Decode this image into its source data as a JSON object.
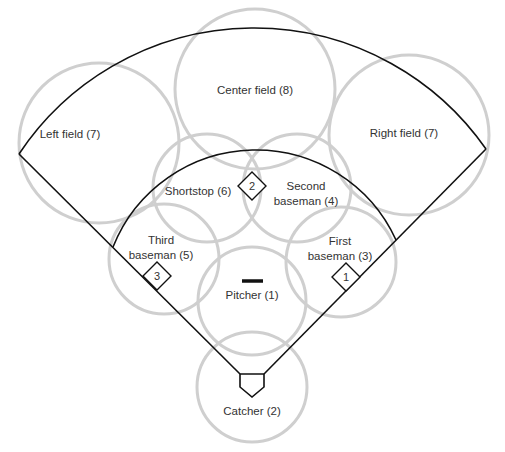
{
  "colors": {
    "coverage_circle": "#cfcfcf",
    "field_line": "#111111",
    "text": "#333333",
    "background": "#ffffff"
  },
  "positions": [
    {
      "id": "left-field",
      "name": "Left field (7)",
      "lines": [
        "Left field (7)"
      ],
      "cx": 99,
      "cy": 143,
      "r": 80,
      "tx": 70,
      "ty": 138
    },
    {
      "id": "center-field",
      "name": "Center field (8)",
      "lines": [
        "Center field (8)"
      ],
      "cx": 255,
      "cy": 89,
      "r": 80,
      "tx": 255,
      "ty": 94
    },
    {
      "id": "right-field",
      "name": "Right field (7)",
      "lines": [
        "Right field (7)"
      ],
      "cx": 409,
      "cy": 135,
      "r": 80,
      "tx": 404,
      "ty": 137
    },
    {
      "id": "shortstop",
      "name": "Shortstop (6)",
      "lines": [
        "Shortstop (6)"
      ],
      "cx": 207,
      "cy": 188,
      "r": 54,
      "tx": 198,
      "ty": 195
    },
    {
      "id": "second-baseman",
      "name": "Second baseman (4)",
      "lines": [
        "Second",
        "baseman (4)"
      ],
      "cx": 297,
      "cy": 188,
      "r": 54,
      "tx": 306,
      "ty": 190
    },
    {
      "id": "third-baseman",
      "name": "Third baseman (5)",
      "lines": [
        "Third",
        "baseman (5)"
      ],
      "cx": 164,
      "cy": 259,
      "r": 55,
      "tx": 161,
      "ty": 244
    },
    {
      "id": "first-baseman",
      "name": "First baseman (3)",
      "lines": [
        "First",
        "baseman (3)"
      ],
      "cx": 341,
      "cy": 262,
      "r": 55,
      "tx": 340,
      "ty": 245
    },
    {
      "id": "pitcher",
      "name": "Pitcher (1)",
      "lines": [
        "Pitcher (1)"
      ],
      "cx": 252,
      "cy": 301,
      "r": 54,
      "tx": 252,
      "ty": 299
    },
    {
      "id": "catcher",
      "name": "Catcher (2)",
      "lines": [
        "Catcher (2)"
      ],
      "cx": 252,
      "cy": 387,
      "r": 55,
      "tx": 252,
      "ty": 415
    }
  ],
  "bases": [
    {
      "id": "second-base",
      "label": "2",
      "cx": 252,
      "cy": 186
    },
    {
      "id": "third-base",
      "label": "3",
      "cx": 157,
      "cy": 276
    },
    {
      "id": "first-base",
      "label": "1",
      "cx": 346,
      "cy": 277
    }
  ],
  "field": {
    "home_plate": {
      "x1": 240,
      "x2": 264,
      "top": 374,
      "side_bottom": 387,
      "point_y": 397
    },
    "left_corner": [
      19,
      154
    ],
    "right_corner": [
      486,
      149
    ],
    "outfield_arc_apex": [
      255,
      28
    ],
    "infield_left": [
      113,
      247
    ],
    "infield_right": [
      396,
      240
    ],
    "infield_arc_apex": [
      252,
      150
    ],
    "pitcher_mound": {
      "x1": 242,
      "x2": 263,
      "y": 281
    }
  }
}
